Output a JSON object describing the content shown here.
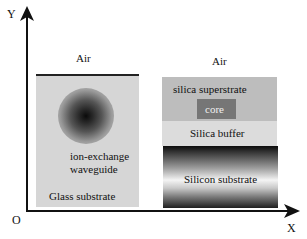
{
  "axes": {
    "y_label": "Y",
    "x_label": "X",
    "origin_label": "O"
  },
  "left_structure": {
    "title": "Ion-exchange waveguide in glass",
    "air_label": "Air",
    "waveguide_label_line1": "ion-exchange",
    "waveguide_label_line2": "waveguide",
    "substrate_label": "Glass substrate"
  },
  "right_structure": {
    "title": "Silica-on-silicon waveguide",
    "air_label": "Air",
    "superstrate_label": "silica superstrate",
    "core_label": "core",
    "buffer_label": "Silica buffer",
    "substrate_label": "Silicon substrate"
  },
  "colors": {
    "axis": "#111111",
    "glass": "#d6d6d6",
    "superstrate": "#bdbdbd",
    "core": "#767676",
    "buffer": "#dcdcdc",
    "core_text": "#f0f0f0"
  }
}
